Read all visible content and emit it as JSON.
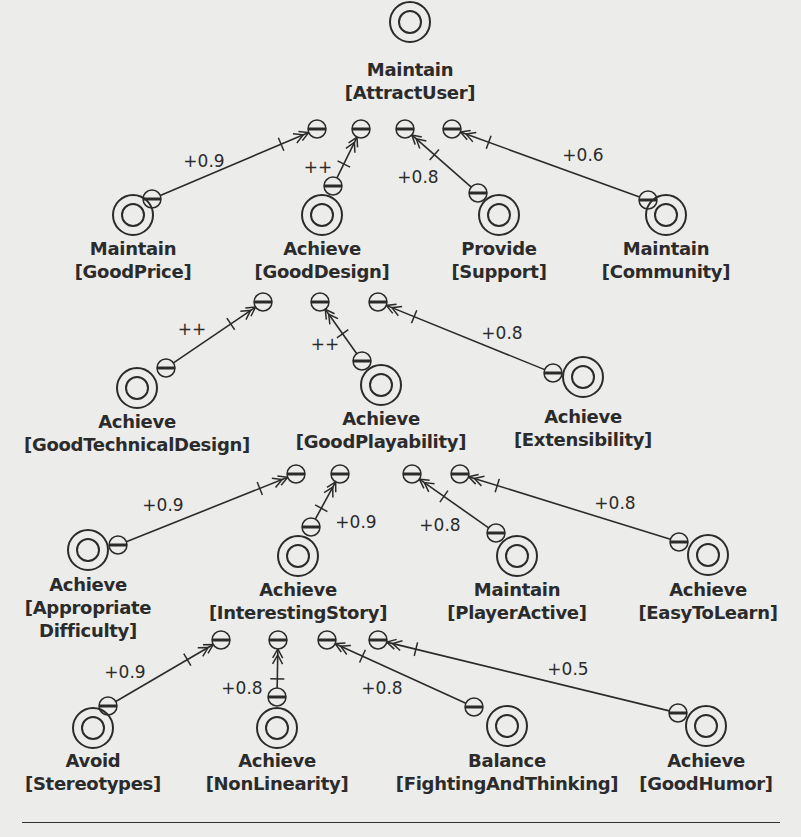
{
  "diagram": {
    "title_goal": "Maintain [AttractUser]",
    "colors": {
      "ink": "#2b2b2b",
      "background": "#ececea"
    },
    "goals": [
      {
        "id": "attract_user",
        "keyword": "Maintain",
        "name": "[AttractUser]"
      },
      {
        "id": "good_price",
        "keyword": "Maintain",
        "name": "[GoodPrice]"
      },
      {
        "id": "good_design",
        "keyword": "Achieve",
        "name": "[GoodDesign]"
      },
      {
        "id": "support",
        "keyword": "Provide",
        "name": "[Support]"
      },
      {
        "id": "community",
        "keyword": "Maintain",
        "name": "[Community]"
      },
      {
        "id": "good_technical_design",
        "keyword": "Achieve",
        "name": "[GoodTechnicalDesign]"
      },
      {
        "id": "good_playability",
        "keyword": "Achieve",
        "name": "[GoodPlayability]"
      },
      {
        "id": "extensibility",
        "keyword": "Achieve",
        "name": "[Extensibility]"
      },
      {
        "id": "appropriate_difficulty",
        "keyword": "Achieve",
        "name": "[Appropriate Difficulty]",
        "name_lines": [
          "[Appropriate",
          "Difficulty]"
        ]
      },
      {
        "id": "interesting_story",
        "keyword": "Achieve",
        "name": "[InterestingStory]"
      },
      {
        "id": "player_active",
        "keyword": "Maintain",
        "name": "[PlayerActive]"
      },
      {
        "id": "easy_to_learn",
        "keyword": "Achieve",
        "name": "[EasyToLearn]"
      },
      {
        "id": "stereotypes",
        "keyword": "Avoid",
        "name": "[Stereotypes]"
      },
      {
        "id": "non_linearity",
        "keyword": "Achieve",
        "name": "[NonLinearity]"
      },
      {
        "id": "fighting_and_thinking",
        "keyword": "Balance",
        "name": "[FightingAndThinking]"
      },
      {
        "id": "good_humor",
        "keyword": "Achieve",
        "name": "[GoodHumor]"
      }
    ],
    "contributions": [
      {
        "from": "good_price",
        "to": "attract_user",
        "weight": "+0.9"
      },
      {
        "from": "good_design",
        "to": "attract_user",
        "weight": "++"
      },
      {
        "from": "support",
        "to": "attract_user",
        "weight": "+0.8"
      },
      {
        "from": "community",
        "to": "attract_user",
        "weight": "+0.6"
      },
      {
        "from": "good_technical_design",
        "to": "good_design",
        "weight": "++"
      },
      {
        "from": "good_playability",
        "to": "good_design",
        "weight": "++"
      },
      {
        "from": "extensibility",
        "to": "good_design",
        "weight": "+0.8"
      },
      {
        "from": "appropriate_difficulty",
        "to": "good_playability",
        "weight": "+0.9"
      },
      {
        "from": "interesting_story",
        "to": "good_playability",
        "weight": "+0.9"
      },
      {
        "from": "player_active",
        "to": "good_playability",
        "weight": "+0.8"
      },
      {
        "from": "easy_to_learn",
        "to": "good_playability",
        "weight": "+0.8"
      },
      {
        "from": "stereotypes",
        "to": "interesting_story",
        "weight": "+0.9"
      },
      {
        "from": "non_linearity",
        "to": "interesting_story",
        "weight": "+0.8"
      },
      {
        "from": "fighting_and_thinking",
        "to": "interesting_story",
        "weight": "+0.8"
      },
      {
        "from": "good_humor",
        "to": "interesting_story",
        "weight": "+0.5"
      }
    ]
  }
}
